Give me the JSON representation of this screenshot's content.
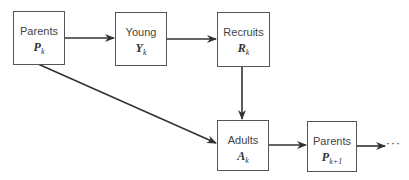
{
  "nodes": [
    {
      "id": "parents_k",
      "label": "Parents",
      "symbol": "P",
      "subscript": "k"
    },
    {
      "id": "young_k",
      "label": "Young",
      "symbol": "Y",
      "subscript": "k"
    },
    {
      "id": "recruits_k",
      "label": "Recruits",
      "symbol": "R",
      "subscript": "k"
    },
    {
      "id": "adults_k",
      "label": "Adults",
      "symbol": "A",
      "subscript": "k"
    },
    {
      "id": "parents_k1",
      "label": "Parents",
      "symbol": "P",
      "subscript": "k+1"
    }
  ],
  "edges": [
    {
      "from": "parents_k",
      "to": "young_k"
    },
    {
      "from": "young_k",
      "to": "recruits_k"
    },
    {
      "from": "recruits_k",
      "to": "adults_k"
    },
    {
      "from": "parents_k",
      "to": "adults_k"
    },
    {
      "from": "adults_k",
      "to": "parents_k1"
    },
    {
      "from": "parents_k1",
      "to": "continuation"
    }
  ],
  "continuation": "···",
  "colors": {
    "line": "#333333",
    "border": "#555555"
  }
}
